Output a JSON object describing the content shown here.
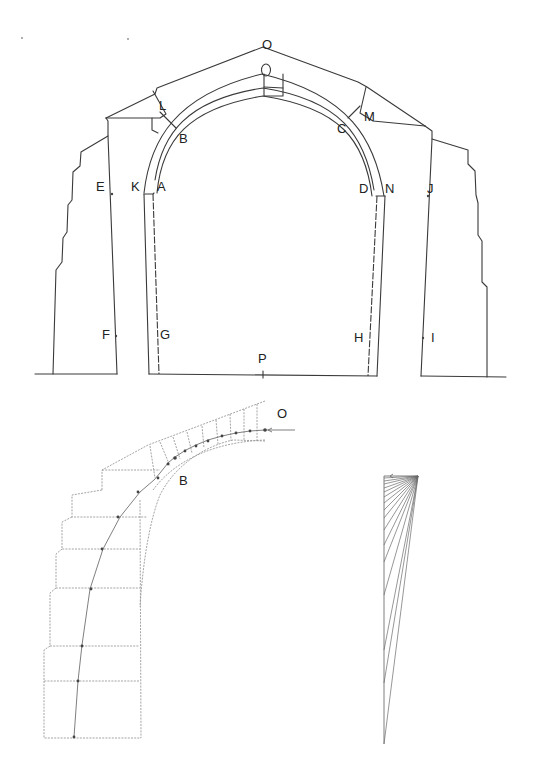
{
  "figure": {
    "type": "masonry arch structural analysis drawing",
    "colors": {
      "ink": "#3a3a3a",
      "faint": "#9a9a9a",
      "background": "#ffffff"
    }
  },
  "elevation": {
    "labels": [
      {
        "id": "O",
        "text": "O",
        "x": 262,
        "y": 49
      },
      {
        "id": "L",
        "text": "L",
        "x": 160,
        "y": 101
      },
      {
        "id": "B",
        "text": "B",
        "x": 179,
        "y": 143
      },
      {
        "id": "M",
        "text": "M",
        "x": 365,
        "y": 121
      },
      {
        "id": "C",
        "text": "C",
        "x": 337,
        "y": 133
      },
      {
        "id": "E",
        "text": "E",
        "x": 96,
        "y": 191
      },
      {
        "id": "K",
        "text": "K",
        "x": 131,
        "y": 191
      },
      {
        "id": "A",
        "text": "A",
        "x": 157,
        "y": 191
      },
      {
        "id": "D",
        "text": "D",
        "x": 359,
        "y": 193
      },
      {
        "id": "N",
        "text": "N",
        "x": 385,
        "y": 193
      },
      {
        "id": "J",
        "text": "J",
        "x": 426,
        "y": 193
      },
      {
        "id": "F",
        "text": "F",
        "x": 102,
        "y": 339
      },
      {
        "id": "G",
        "text": "G",
        "x": 160,
        "y": 339
      },
      {
        "id": "H",
        "text": "H",
        "x": 354,
        "y": 342
      },
      {
        "id": "I",
        "text": "I",
        "x": 433,
        "y": 342
      },
      {
        "id": "P",
        "text": "P",
        "x": 258,
        "y": 363
      }
    ]
  },
  "thrust_line": {
    "labels": [
      {
        "id": "O",
        "text": "O",
        "x": 277,
        "y": 418
      },
      {
        "id": "B",
        "text": "B",
        "x": 179,
        "y": 485
      }
    ]
  },
  "force_polygon": {
    "description": "fan of force rays"
  }
}
